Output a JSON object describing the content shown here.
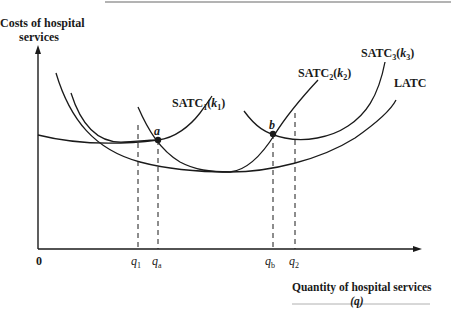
{
  "diagram": {
    "y_axis_label_line1": "Costs of hospital",
    "y_axis_label_line2": "services",
    "x_axis_label_line1": "Quantity of hospital services",
    "x_axis_label_line2": "(q)",
    "origin_label": "0",
    "ticks": [
      {
        "id": "q1",
        "base": "q",
        "sub": "1"
      },
      {
        "id": "qa",
        "base": "q",
        "sub": "a"
      },
      {
        "id": "qb",
        "base": "q",
        "sub": "b"
      },
      {
        "id": "q2",
        "base": "q",
        "sub": "2"
      }
    ],
    "curves": [
      {
        "id": "satc1",
        "name": "SATC",
        "sub": "1",
        "param": "k",
        "param_sub": "1"
      },
      {
        "id": "satc2",
        "name": "SATC",
        "sub": "2",
        "param": "k",
        "param_sub": "2"
      },
      {
        "id": "satc3",
        "name": "SATC",
        "sub": "3",
        "param": "k",
        "param_sub": "3"
      },
      {
        "id": "latc",
        "name": "LATC"
      }
    ],
    "points": [
      {
        "id": "a",
        "label": "a"
      },
      {
        "id": "b",
        "label": "b"
      }
    ],
    "colors": {
      "line": "#1a1a1a",
      "rule": "#9a9a9a"
    }
  }
}
